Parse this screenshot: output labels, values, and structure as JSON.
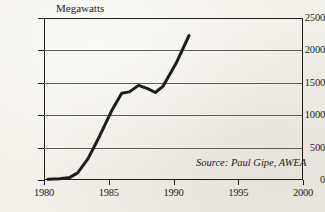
{
  "chart_data": {
    "type": "line",
    "title": "Megawatts",
    "xlabel": "",
    "ylabel": "Megawatts",
    "xlim": [
      1980,
      2000
    ],
    "ylim": [
      0,
      2500
    ],
    "grid": true,
    "grid_axis": "y",
    "legend": "none",
    "annotations": [
      {
        "name": "source-note",
        "text": "Source: Paul Gipe, AWEA",
        "style": "italic",
        "position": "inside lower-right of plot area"
      }
    ],
    "y_ticks": [
      0,
      500,
      1000,
      1500,
      2000,
      2500
    ],
    "y_tick_labels": [
      "0",
      "500",
      "1000",
      "1500",
      "2000",
      "2500"
    ],
    "x_ticks": [
      1980,
      1985,
      1990,
      1995,
      2000
    ],
    "x_tick_labels": [
      "1980",
      "1985",
      "1990",
      "1995",
      "2000"
    ],
    "series": [
      {
        "name": "US wind capacity",
        "color": "#1d1d1d",
        "line_width": 3,
        "x": [
          1980.3,
          1981.2,
          1982.0,
          1982.6,
          1983.4,
          1984.3,
          1985.2,
          1986.0,
          1986.6,
          1987.3,
          1988.0,
          1988.6,
          1989.2,
          1990.2,
          1991.2
        ],
        "values": [
          10,
          20,
          40,
          110,
          330,
          680,
          1060,
          1340,
          1360,
          1460,
          1410,
          1350,
          1450,
          1800,
          2230
        ]
      }
    ]
  },
  "figure": {
    "axis_title": "Megawatts",
    "source_text": "Source: Paul Gipe, AWEA",
    "colors": {
      "paper": "#f4f1ea",
      "ink": "#1d1d1d",
      "gridline": "#5d5d5d"
    }
  }
}
